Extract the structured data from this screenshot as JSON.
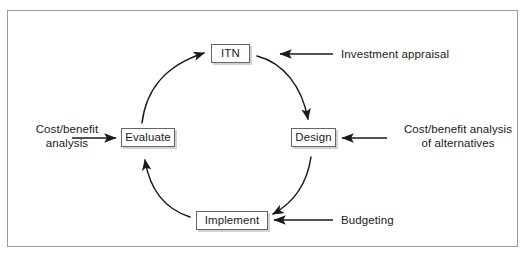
{
  "figure": {
    "type": "cycle-diagram",
    "border_color": "#9a9a9a",
    "background": "#ffffff",
    "text_color": "#1a1a1a",
    "node_border_color": "#666666",
    "node_shadow_color": "#d2d2d2",
    "arrow_color": "#1a1a1a"
  },
  "cycle": {
    "direction": "clockwise",
    "nodes": [
      {
        "id": "itn",
        "label": "ITN",
        "position": "top"
      },
      {
        "id": "design",
        "label": "Design",
        "position": "right"
      },
      {
        "id": "implement",
        "label": "Implement",
        "position": "bottom"
      },
      {
        "id": "evaluate",
        "label": "Evaluate",
        "position": "left"
      }
    ],
    "transitions": [
      {
        "from": "ITN",
        "to": "Design"
      },
      {
        "from": "Design",
        "to": "Implement"
      },
      {
        "from": "Implement",
        "to": "Evaluate"
      },
      {
        "from": "Evaluate",
        "to": "ITN"
      }
    ]
  },
  "annotations": [
    {
      "id": "investment-appraisal",
      "text": "Investment appraisal",
      "points_to": "ITN",
      "arrow_direction": "left",
      "side": "right"
    },
    {
      "id": "cost-benefit-alternatives",
      "text": "Cost/benefit analysis\nof alternatives",
      "points_to": "Design",
      "arrow_direction": "left",
      "side": "right"
    },
    {
      "id": "budgeting",
      "text": "Budgeting",
      "points_to": "Implement",
      "arrow_direction": "left",
      "side": "right"
    },
    {
      "id": "cost-benefit-analysis",
      "text": "Cost/benefit\nanalysis",
      "points_to": "Evaluate",
      "arrow_direction": "right",
      "side": "left"
    }
  ]
}
